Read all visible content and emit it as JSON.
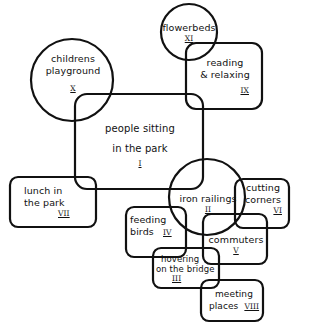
{
  "diagram": {
    "title": "",
    "nodes": [
      {
        "id": "I",
        "label_lines": [
          "people sitting",
          "in the park"
        ],
        "numeral": "I",
        "shape": "rounded-rect"
      },
      {
        "id": "II",
        "label_lines": [
          "iron railings"
        ],
        "numeral": "II",
        "shape": "circle"
      },
      {
        "id": "III",
        "label_lines": [
          "hovering",
          "on the bridge"
        ],
        "numeral": "III",
        "shape": "rounded-rect"
      },
      {
        "id": "IV",
        "label_lines": [
          "feeding",
          "birds"
        ],
        "numeral": "IV",
        "shape": "rounded-rect"
      },
      {
        "id": "V",
        "label_lines": [
          "commuters"
        ],
        "numeral": "V",
        "shape": "rounded-rect"
      },
      {
        "id": "VI",
        "label_lines": [
          "cutting",
          "corners"
        ],
        "numeral": "VI",
        "shape": "rounded-rect"
      },
      {
        "id": "VII",
        "label_lines": [
          "lunch in",
          "the park"
        ],
        "numeral": "VII",
        "shape": "rounded-rect"
      },
      {
        "id": "VIII",
        "label_lines": [
          "meeting",
          "places"
        ],
        "numeral": "VIII",
        "shape": "rounded-rect"
      },
      {
        "id": "IX",
        "label_lines": [
          "reading",
          "& relaxing"
        ],
        "numeral": "IX",
        "shape": "rounded-rect"
      },
      {
        "id": "X",
        "label_lines": [
          "childrens",
          "playground"
        ],
        "numeral": "X",
        "shape": "circle"
      },
      {
        "id": "XI",
        "label_lines": [
          "flowerbeds"
        ],
        "numeral": "XI",
        "shape": "circle"
      }
    ]
  },
  "colors": {
    "stroke": "#111111",
    "background": "#ffffff"
  }
}
